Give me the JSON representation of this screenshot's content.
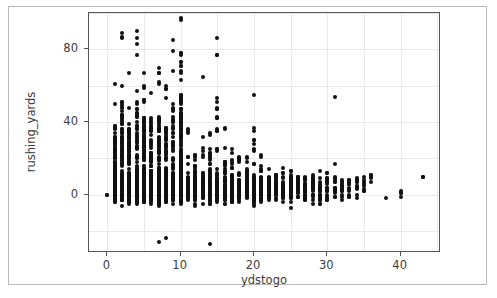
{
  "figure": {
    "background_color": "#ffffff",
    "frame_color": "#b9b9b9",
    "axes_color": "#555555",
    "grid_color": "#e9e9e9",
    "point_color": "#111111"
  },
  "chart_data": {
    "type": "scatter",
    "title": "",
    "xlabel": "ydstogo",
    "ylabel": "rushing_yards",
    "xlim": [
      -2.5,
      45.5
    ],
    "ylim": [
      -32,
      100
    ],
    "grid": true,
    "legend": null,
    "xticks": [
      0,
      10,
      20,
      30,
      40
    ],
    "xticklabels": [
      "0",
      "10",
      "20",
      "30",
      "40"
    ],
    "yticks": [
      0,
      40,
      80
    ],
    "yticklabels": [
      "0",
      "40",
      "80"
    ],
    "x_minor_grid_step": 5,
    "y_minor_grid_step": 20,
    "marker": "circle",
    "marker_size_px": 4,
    "columns": [
      {
        "x": 0,
        "count": 1,
        "y_min": 0,
        "y_max": 0,
        "y_typical": 0
      },
      {
        "x": 1,
        "count": 320,
        "y_min": -14,
        "y_max": 66,
        "y_typical": 4
      },
      {
        "x": 2,
        "count": 330,
        "y_min": -15,
        "y_max": 89,
        "y_typical": 4
      },
      {
        "x": 3,
        "count": 300,
        "y_min": -14,
        "y_max": 67,
        "y_typical": 4
      },
      {
        "x": 4,
        "count": 290,
        "y_min": -14,
        "y_max": 90,
        "y_typical": 4
      },
      {
        "x": 5,
        "count": 300,
        "y_min": -15,
        "y_max": 74,
        "y_typical": 4
      },
      {
        "x": 6,
        "count": 290,
        "y_min": -15,
        "y_max": 74,
        "y_typical": 4
      },
      {
        "x": 7,
        "count": 280,
        "y_min": -26,
        "y_max": 76,
        "y_typical": 4
      },
      {
        "x": 8,
        "count": 270,
        "y_min": -24,
        "y_max": 64,
        "y_typical": 4
      },
      {
        "x": 9,
        "count": 250,
        "y_min": -19,
        "y_max": 85,
        "y_typical": 4
      },
      {
        "x": 10,
        "count": 620,
        "y_min": -17,
        "y_max": 97,
        "y_typical": 4
      },
      {
        "x": 11,
        "count": 90,
        "y_min": -14,
        "y_max": 64,
        "y_typical": 3
      },
      {
        "x": 12,
        "count": 80,
        "y_min": -12,
        "y_max": 44,
        "y_typical": 3
      },
      {
        "x": 13,
        "count": 75,
        "y_min": -12,
        "y_max": 66,
        "y_typical": 3
      },
      {
        "x": 14,
        "count": 70,
        "y_min": -27,
        "y_max": 41,
        "y_typical": 3
      },
      {
        "x": 15,
        "count": 95,
        "y_min": -15,
        "y_max": 86,
        "y_typical": 3
      },
      {
        "x": 16,
        "count": 70,
        "y_min": -10,
        "y_max": 37,
        "y_typical": 3
      },
      {
        "x": 17,
        "count": 65,
        "y_min": -10,
        "y_max": 31,
        "y_typical": 3
      },
      {
        "x": 18,
        "count": 60,
        "y_min": -10,
        "y_max": 36,
        "y_typical": 3
      },
      {
        "x": 19,
        "count": 60,
        "y_min": -12,
        "y_max": 30,
        "y_typical": 3
      },
      {
        "x": 20,
        "count": 85,
        "y_min": -13,
        "y_max": 67,
        "y_typical": 3
      },
      {
        "x": 21,
        "count": 55,
        "y_min": -9,
        "y_max": 24,
        "y_typical": 3
      },
      {
        "x": 22,
        "count": 50,
        "y_min": -9,
        "y_max": 22,
        "y_typical": 3
      },
      {
        "x": 23,
        "count": 45,
        "y_min": -9,
        "y_max": 22,
        "y_typical": 3
      },
      {
        "x": 24,
        "count": 45,
        "y_min": -8,
        "y_max": 29,
        "y_typical": 3
      },
      {
        "x": 25,
        "count": 45,
        "y_min": -9,
        "y_max": 23,
        "y_typical": 3
      },
      {
        "x": 26,
        "count": 35,
        "y_min": -8,
        "y_max": 16,
        "y_typical": 3
      },
      {
        "x": 27,
        "count": 30,
        "y_min": -8,
        "y_max": 16,
        "y_typical": 3
      },
      {
        "x": 28,
        "count": 28,
        "y_min": -7,
        "y_max": 17,
        "y_typical": 3
      },
      {
        "x": 29,
        "count": 25,
        "y_min": -10,
        "y_max": 25,
        "y_typical": 3
      },
      {
        "x": 30,
        "count": 22,
        "y_min": -6,
        "y_max": 16,
        "y_typical": 3
      },
      {
        "x": 31,
        "count": 18,
        "y_min": -5,
        "y_max": 54,
        "y_typical": 3
      },
      {
        "x": 32,
        "count": 14,
        "y_min": -4,
        "y_max": 13,
        "y_typical": 3
      },
      {
        "x": 33,
        "count": 12,
        "y_min": -3,
        "y_max": 14,
        "y_typical": 3
      },
      {
        "x": 34,
        "count": 12,
        "y_min": -3,
        "y_max": 15,
        "y_typical": 4
      },
      {
        "x": 35,
        "count": 8,
        "y_min": 1,
        "y_max": 10,
        "y_typical": 5
      },
      {
        "x": 36,
        "count": 5,
        "y_min": 5,
        "y_max": 13,
        "y_typical": 8
      },
      {
        "x": 38,
        "count": 1,
        "y_min": -2,
        "y_max": -2,
        "y_typical": -2
      },
      {
        "x": 40,
        "count": 4,
        "y_min": -3,
        "y_max": 4,
        "y_typical": 0
      },
      {
        "x": 43,
        "count": 1,
        "y_min": 10,
        "y_max": 10,
        "y_typical": 10
      }
    ],
    "outliers": [
      {
        "x": 2,
        "y": 89
      },
      {
        "x": 4,
        "y": 90
      },
      {
        "x": 9,
        "y": 85
      },
      {
        "x": 10,
        "y": 97
      },
      {
        "x": 15,
        "y": 86
      },
      {
        "x": 31,
        "y": 54
      },
      {
        "x": 7,
        "y": -26
      },
      {
        "x": 8,
        "y": -24
      },
      {
        "x": 14,
        "y": -27
      },
      {
        "x": 0,
        "y": 0
      },
      {
        "x": 43,
        "y": 10
      }
    ]
  }
}
